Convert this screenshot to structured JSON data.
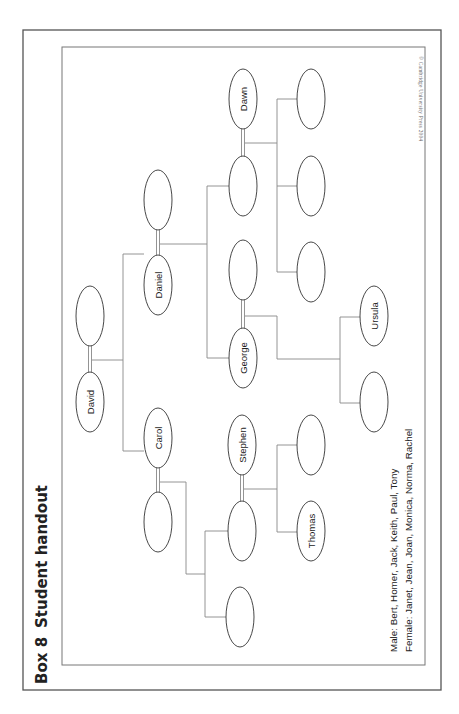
{
  "header": {
    "box_label": "Box 8",
    "title": "Student handout"
  },
  "copyright": "© Cambridge University Press 2004",
  "legend": {
    "male": "Male: Bert, Homer, Jack, Keith, Paul, Tony",
    "female": "Female: Janet, Jean, Joan, Monica, Norma, Rachel"
  },
  "colors": {
    "outer_border": "#555555",
    "inner_border": "#777777",
    "lines": "#888888",
    "ellipse_stroke": "#333333",
    "text": "#222222"
  },
  "nodes": [
    {
      "id": "david",
      "label": "David",
      "cx": 90,
      "cy": 402
    },
    {
      "id": "david-spouse",
      "label": "",
      "cx": 90,
      "cy": 316
    },
    {
      "id": "daniel",
      "label": "Daniel",
      "cx": 158,
      "cy": 285
    },
    {
      "id": "daniel-spouse",
      "label": "",
      "cx": 158,
      "cy": 200
    },
    {
      "id": "carol",
      "label": "Carol",
      "cx": 158,
      "cy": 438
    },
    {
      "id": "carol-spouse",
      "label": "",
      "cx": 158,
      "cy": 522
    },
    {
      "id": "dawn",
      "label": "Dawn",
      "cx": 243,
      "cy": 99
    },
    {
      "id": "dawn-spouse",
      "label": "",
      "cx": 243,
      "cy": 186
    },
    {
      "id": "george-spouse",
      "label": "",
      "cx": 243,
      "cy": 270
    },
    {
      "id": "george",
      "label": "George",
      "cx": 243,
      "cy": 358
    },
    {
      "id": "stephen",
      "label": "Stephen",
      "cx": 242,
      "cy": 445
    },
    {
      "id": "stephen-spouse",
      "label": "",
      "cx": 242,
      "cy": 531
    },
    {
      "id": "carol-child-2",
      "label": "",
      "cx": 240,
      "cy": 617
    },
    {
      "id": "dawn-child-1",
      "label": "",
      "cx": 311,
      "cy": 99
    },
    {
      "id": "dawn-child-2",
      "label": "",
      "cx": 311,
      "cy": 186
    },
    {
      "id": "dawn-child-3",
      "label": "",
      "cx": 311,
      "cy": 272
    },
    {
      "id": "stephen-child-1",
      "label": "",
      "cx": 311,
      "cy": 445
    },
    {
      "id": "thomas",
      "label": "Thomas",
      "cx": 311,
      "cy": 531
    },
    {
      "id": "ursula",
      "label": "Ursula",
      "cx": 374,
      "cy": 316
    },
    {
      "id": "george-child-2",
      "label": "",
      "cx": 374,
      "cy": 402
    }
  ]
}
